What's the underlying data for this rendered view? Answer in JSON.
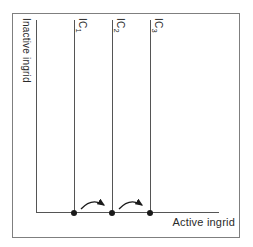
{
  "figure": {
    "y_axis_label": "Inactive ingrid",
    "x_axis_label": "Active ingrid",
    "curves": [
      {
        "label_base": "IC",
        "label_sub": "1"
      },
      {
        "label_base": "IC",
        "label_sub": "2"
      },
      {
        "label_base": "IC",
        "label_sub": "3"
      }
    ],
    "colors": {
      "line": "#555555",
      "border": "#7f7f7f",
      "marker": "#1a1a1a",
      "text": "#2a2a2a",
      "background": "#ffffff"
    }
  }
}
